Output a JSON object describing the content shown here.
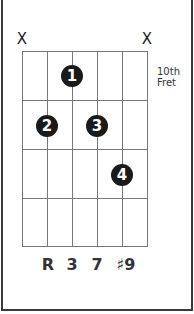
{
  "chord_diagram": {
    "muted_strings": [
      {
        "string": 6,
        "label": "X"
      },
      {
        "string": 1,
        "label": "X"
      }
    ],
    "position_label": {
      "line1": "10th",
      "line2": "Fret"
    },
    "strings": 6,
    "frets": 4,
    "fingers": [
      {
        "finger": "1",
        "string": 4,
        "fret": 1
      },
      {
        "finger": "2",
        "string": 5,
        "fret": 2
      },
      {
        "finger": "3",
        "string": 3,
        "fret": 2
      },
      {
        "finger": "4",
        "string": 2,
        "fret": 3
      }
    ],
    "intervals": [
      "R",
      "3",
      "7",
      "♯9"
    ],
    "colors": {
      "dot": "#1a1a1a",
      "grid": "#777777",
      "frame": "#3a3a3a"
    }
  }
}
